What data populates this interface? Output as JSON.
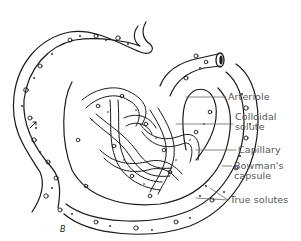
{
  "diagram": {
    "colors": {
      "line": "#1a1a1a",
      "label_text": "#555555",
      "leader_line": "#666666",
      "background": "#ffffff"
    },
    "labels": [
      {
        "id": "arteriole",
        "text": "Arteriole"
      },
      {
        "id": "colloidal-solute",
        "line1": "Colloidal",
        "line2": "solute"
      },
      {
        "id": "capillary",
        "text": "Capillary"
      },
      {
        "id": "bowmans-capsule",
        "line1": "Bowman's",
        "line2": "capsule"
      },
      {
        "id": "true-solutes",
        "text": "True solutes"
      }
    ],
    "signature": "B"
  }
}
